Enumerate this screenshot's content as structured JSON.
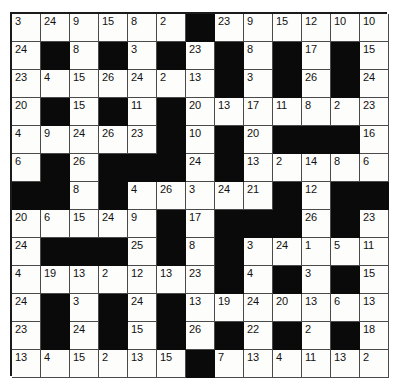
{
  "puzzle": {
    "type": "codeword-grid",
    "title": "Codeword Puzzle Grid",
    "rows": 13,
    "columns": 13,
    "block_marker": null,
    "colors": {
      "block": "#0a0a0a",
      "cell_background": "#fdfdfb",
      "grid_line": "#4a4a4a",
      "border": "#1a1a1a",
      "number_text": "#111111"
    },
    "grid": [
      [
        3,
        24,
        9,
        15,
        8,
        2,
        null,
        23,
        9,
        15,
        12,
        10,
        10
      ],
      [
        24,
        null,
        8,
        null,
        3,
        null,
        23,
        null,
        8,
        null,
        17,
        null,
        15
      ],
      [
        23,
        4,
        15,
        26,
        24,
        2,
        13,
        null,
        3,
        null,
        26,
        null,
        24
      ],
      [
        20,
        null,
        15,
        null,
        11,
        null,
        20,
        13,
        17,
        11,
        8,
        2,
        23
      ],
      [
        4,
        9,
        24,
        26,
        23,
        null,
        10,
        null,
        20,
        null,
        null,
        null,
        16
      ],
      [
        6,
        null,
        26,
        null,
        null,
        null,
        24,
        null,
        13,
        2,
        14,
        8,
        6
      ],
      [
        null,
        null,
        8,
        null,
        4,
        26,
        3,
        24,
        21,
        null,
        12,
        null,
        null
      ],
      [
        20,
        6,
        15,
        24,
        9,
        null,
        17,
        null,
        null,
        null,
        26,
        null,
        23
      ],
      [
        24,
        null,
        null,
        null,
        25,
        null,
        8,
        null,
        3,
        24,
        1,
        5,
        11
      ],
      [
        4,
        19,
        13,
        2,
        12,
        13,
        23,
        null,
        4,
        null,
        3,
        null,
        15
      ],
      [
        24,
        null,
        3,
        null,
        24,
        null,
        13,
        19,
        24,
        20,
        13,
        6,
        13
      ],
      [
        23,
        null,
        24,
        null,
        15,
        null,
        26,
        null,
        22,
        null,
        2,
        null,
        18
      ],
      [
        13,
        4,
        15,
        2,
        13,
        15,
        null,
        7,
        13,
        4,
        11,
        13,
        2
      ]
    ]
  }
}
